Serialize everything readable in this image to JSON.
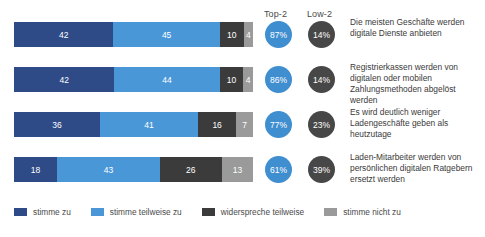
{
  "chart_data": {
    "type": "bar",
    "subtype": "stacked-horizontal-100",
    "title": "",
    "xlabel": "",
    "ylabel": "",
    "xlim": [
      0,
      100
    ],
    "grid": false,
    "legend_position": "bottom",
    "categories": [
      "Die meisten Geschäfte werden digitale Dienste anbieten",
      "Registrierkassen werden von digitalen oder mobilen Zahlungsmethoden abgelöst werden",
      "Es wird deutlich weniger Ladengeschäfte geben als heutzutage",
      "Laden-Mitarbeiter werden von persönlichen digitalen Ratgebern ersetzt werden"
    ],
    "series": [
      {
        "name": "stimme zu",
        "color": "#2e4a87",
        "values": [
          42,
          42,
          36,
          18
        ]
      },
      {
        "name": "stimme teilweise zu",
        "color": "#4a97d8",
        "values": [
          45,
          44,
          41,
          43
        ]
      },
      {
        "name": "widerspreche teilweise",
        "color": "#3b3b3b",
        "values": [
          10,
          10,
          16,
          26
        ]
      },
      {
        "name": "stimme nicht zu",
        "color": "#9a9a9a",
        "values": [
          4,
          4,
          7,
          13
        ]
      }
    ],
    "annotations": {
      "top2_header": "Top-2",
      "low2_header": "Low-2",
      "top2_values": [
        "87%",
        "86%",
        "77%",
        "61%"
      ],
      "low2_values": [
        "14%",
        "14%",
        "23%",
        "39%"
      ]
    }
  },
  "header": {
    "top2": "Top-2",
    "low2": "Low-2"
  },
  "rows": [
    {
      "segments": [
        {
          "label": "42",
          "value": 42
        },
        {
          "label": "45",
          "value": 45
        },
        {
          "label": "10",
          "value": 10
        },
        {
          "label": "4",
          "value": 4
        }
      ],
      "top2": "87%",
      "low2": "14%",
      "statement": "Die meisten Geschäfte werden digitale Dienste anbieten"
    },
    {
      "segments": [
        {
          "label": "42",
          "value": 42
        },
        {
          "label": "44",
          "value": 44
        },
        {
          "label": "10",
          "value": 10
        },
        {
          "label": "4",
          "value": 4
        }
      ],
      "top2": "86%",
      "low2": "14%",
      "statement": "Registrierkassen werden von digitalen oder mobilen Zahlungsmethoden abgelöst werden"
    },
    {
      "segments": [
        {
          "label": "36",
          "value": 36
        },
        {
          "label": "41",
          "value": 41
        },
        {
          "label": "16",
          "value": 16
        },
        {
          "label": "7",
          "value": 7
        }
      ],
      "top2": "77%",
      "low2": "23%",
      "statement": "Es wird deutlich weniger Ladengeschäfte geben als heutzutage"
    },
    {
      "segments": [
        {
          "label": "18",
          "value": 18
        },
        {
          "label": "43",
          "value": 43
        },
        {
          "label": "26",
          "value": 26
        },
        {
          "label": "13",
          "value": 13
        }
      ],
      "top2": "61%",
      "low2": "39%",
      "statement": "Laden-Mitarbeiter werden von persönlichen digitalen Ratgebern ersetzt werden"
    }
  ],
  "legend": [
    {
      "label": "stimme zu",
      "color": "#2e4a87"
    },
    {
      "label": "stimme teilweise zu",
      "color": "#4a97d8"
    },
    {
      "label": "widerspreche teilweise",
      "color": "#3b3b3b"
    },
    {
      "label": "stimme nicht zu",
      "color": "#9a9a9a"
    }
  ]
}
